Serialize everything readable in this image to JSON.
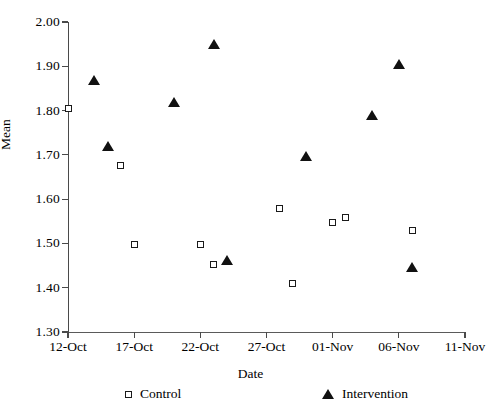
{
  "chart_data": {
    "type": "scatter",
    "title": "",
    "xlabel": "Date",
    "ylabel": "Mean",
    "ylim": [
      1.3,
      2.0
    ],
    "ytick_labels": [
      "2.00",
      "1.90",
      "1.80",
      "1.70",
      "1.60",
      "1.50",
      "1.40",
      "1.30"
    ],
    "ytick_values": [
      2.0,
      1.9,
      1.8,
      1.7,
      1.6,
      1.5,
      1.4,
      1.3
    ],
    "xtick_labels": [
      "12-Oct",
      "17-Oct",
      "22-Oct",
      "27-Oct",
      "01-Nov",
      "06-Nov",
      "11-Nov"
    ],
    "xtick_values": [
      0,
      5,
      10,
      15,
      20,
      25,
      30
    ],
    "xlim": [
      0,
      30
    ],
    "grid": false,
    "legend_position": "bottom",
    "series": [
      {
        "name": "Control",
        "marker": "open-square",
        "color": "#1a1a1a",
        "points": [
          {
            "x": 0,
            "date": "12-Oct",
            "y": 1.805
          },
          {
            "x": 4,
            "date": "16-Oct",
            "y": 1.675
          },
          {
            "x": 5,
            "date": "17-Oct",
            "y": 1.497
          },
          {
            "x": 10,
            "date": "22-Oct",
            "y": 1.498
          },
          {
            "x": 11,
            "date": "23-Oct",
            "y": 1.453
          },
          {
            "x": 16,
            "date": "28-Oct",
            "y": 1.578
          },
          {
            "x": 17,
            "date": "29-Oct",
            "y": 1.41
          },
          {
            "x": 20,
            "date": "01-Nov",
            "y": 1.548
          },
          {
            "x": 21,
            "date": "02-Nov",
            "y": 1.558
          },
          {
            "x": 26,
            "date": "07-Nov",
            "y": 1.53
          }
        ]
      },
      {
        "name": "Intervention",
        "marker": "filled-triangle",
        "color": "#111111",
        "points": [
          {
            "x": 2,
            "date": "14-Oct",
            "y": 1.868
          },
          {
            "x": 3,
            "date": "15-Oct",
            "y": 1.72
          },
          {
            "x": 8,
            "date": "20-Oct",
            "y": 1.82
          },
          {
            "x": 11,
            "date": "23-Oct",
            "y": 1.95
          },
          {
            "x": 12,
            "date": "24-Oct",
            "y": 1.463
          },
          {
            "x": 18,
            "date": "30-Oct",
            "y": 1.697
          },
          {
            "x": 23,
            "date": "04-Nov",
            "y": 1.79
          },
          {
            "x": 25,
            "date": "06-Nov",
            "y": 1.905
          },
          {
            "x": 26,
            "date": "07-Nov",
            "y": 1.447
          }
        ]
      }
    ]
  },
  "legend": {
    "control_label": "Control",
    "intervention_label": "Intervention"
  }
}
